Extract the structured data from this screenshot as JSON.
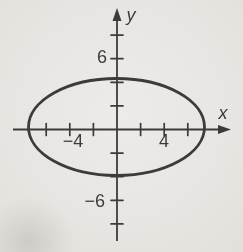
{
  "figure": {
    "colors": {
      "background": "#e8e6e2",
      "ink": "#3d3b38"
    },
    "axes": {
      "origin_x": 117,
      "origin_y": 129.5,
      "px_per_unit": 11.8,
      "x_line_start": 13,
      "x_line_end": 223,
      "x_arrow_tip": 231,
      "y_line_start": 241,
      "y_line_end": 16,
      "y_arrow_tip": 8,
      "x_ticks": [
        -6,
        -4,
        -2,
        2,
        4,
        6
      ],
      "y_ticks": [
        -8,
        -6,
        -4,
        -2,
        2,
        4,
        6,
        8
      ],
      "tick_half_length": 6
    },
    "strokes": {
      "axis": 1.8,
      "tick": 1.7,
      "curve": 2.8
    },
    "ellipse": {
      "cx": 116.5,
      "cy": 127,
      "rx": 88,
      "ry": 48.5
    },
    "labels": [
      {
        "name": "y-axis-label",
        "text": "y",
        "x": 126.5,
        "y": 21,
        "anchor": "start",
        "italic": true,
        "size": 18
      },
      {
        "name": "x-axis-label",
        "text": "x",
        "x": 223,
        "y": 119,
        "anchor": "middle",
        "italic": true,
        "size": 18
      },
      {
        "name": "y-tick-label-6",
        "text": "6",
        "x": 107,
        "y": 63,
        "anchor": "end",
        "italic": false,
        "size": 18
      },
      {
        "name": "y-tick-label-neg6",
        "text": "−6",
        "x": 105,
        "y": 207,
        "anchor": "end",
        "italic": false,
        "size": 18
      },
      {
        "name": "x-tick-label-neg4",
        "text": "−4",
        "x": 73,
        "y": 146.5,
        "anchor": "middle",
        "italic": false,
        "size": 18
      },
      {
        "name": "x-tick-label-4",
        "text": "4",
        "x": 164,
        "y": 146.5,
        "anchor": "middle",
        "italic": false,
        "size": 18
      }
    ]
  },
  "chart_data": {
    "type": "line",
    "title": "",
    "xlabel": "x",
    "ylabel": "y",
    "grid": false,
    "legend": false,
    "x_tick_step": 2,
    "y_tick_step": 2,
    "x_labeled_ticks": [
      -4,
      4
    ],
    "y_labeled_ticks": [
      6,
      -6
    ],
    "xlim": [
      -8.8,
      9.7
    ],
    "ylim": [
      -9.5,
      10.3
    ],
    "series": [
      {
        "name": "ellipse",
        "shape": "ellipse",
        "center": [
          0,
          0
        ],
        "semi_axis_x": 7.4,
        "semi_axis_y": 4.1,
        "x_intercepts": [
          -7.4,
          7.4
        ],
        "y_intercepts": [
          -4.1,
          4.1
        ]
      }
    ]
  }
}
